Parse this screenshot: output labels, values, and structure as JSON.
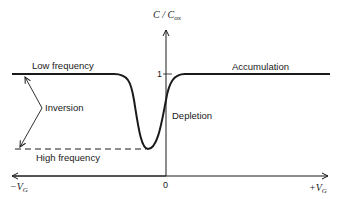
{
  "diagram": {
    "y_axis": {
      "label_main": "C / C",
      "label_sub": "ox",
      "tick_one": "1"
    },
    "x_axis": {
      "origin": "0",
      "left_main": "−V",
      "left_sub": "G",
      "right_main": "+V",
      "right_sub": "G"
    },
    "regions": {
      "low_frequency": "Low frequency",
      "high_frequency": "High frequency",
      "inversion": "Inversion",
      "depletion": "Depletion",
      "accumulation": "Accumulation"
    },
    "colors": {
      "ink": "#1a1a1a",
      "background": "#ffffff"
    }
  }
}
